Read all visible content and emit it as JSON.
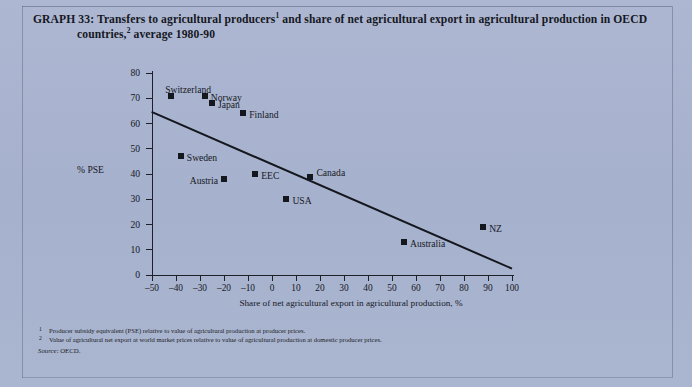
{
  "page": {
    "background_color": "#a9b4cf",
    "ink_color": "#16181f"
  },
  "title": {
    "line1_prefix": "GRAPH 33: Transfers to agricultural producers",
    "line1_sup": "1",
    "line1_rest": " and share of net agricultural export in agricultural production in OECD",
    "line2_prefix": "countries,",
    "line2_sup": "2",
    "line2_rest": " average 1980-90"
  },
  "notes": {
    "note1_marker": "1",
    "note1": "Producer subsidy equivalent (PSE) relative to value of agricultural production at producer prices.",
    "note2_marker": "2",
    "note2": "Value of agricultural net export at world market prices relative to value of agricultural production at domestic producer prices.",
    "source_label": "Source",
    "source_value": ": OECD."
  },
  "chart_data": {
    "type": "scatter",
    "xlabel": "Share of net agricultural export in agricultural production, %",
    "ylabel": "% PSE",
    "xlim": [
      -50,
      100
    ],
    "ylim": [
      0,
      80
    ],
    "xticks": [
      -50,
      -40,
      -30,
      -20,
      -10,
      0,
      10,
      20,
      30,
      40,
      50,
      60,
      70,
      80,
      90,
      100
    ],
    "xticklabels": [
      "–50",
      "–40",
      "–30",
      "–20",
      "–10",
      "0",
      "10",
      "20",
      "30",
      "40",
      "50",
      "60",
      "70",
      "80",
      "90",
      "100"
    ],
    "yticks": [
      0,
      10,
      20,
      30,
      40,
      50,
      60,
      70,
      80
    ],
    "yticklabels": [
      "0",
      "10",
      "20",
      "30",
      "40",
      "50",
      "60",
      "70",
      "80"
    ],
    "grid": false,
    "legend": "none",
    "marker_color": "#15171e",
    "points": [
      {
        "label": "Switzerland",
        "x": -42,
        "y": 71,
        "label_dx": -6,
        "label_dy": -12,
        "label_align": "left"
      },
      {
        "label": "Norway",
        "x": -28,
        "y": 71,
        "label_dx": 6,
        "label_dy": -4,
        "label_align": "left"
      },
      {
        "label": "Japan",
        "x": -25,
        "y": 68,
        "label_dx": 6,
        "label_dy": -4,
        "label_align": "left"
      },
      {
        "label": "Finland",
        "x": -12,
        "y": 64,
        "label_dx": 6,
        "label_dy": -4,
        "label_align": "left"
      },
      {
        "label": "Sweden",
        "x": -38,
        "y": 47,
        "label_dx": 6,
        "label_dy": -4,
        "label_align": "left"
      },
      {
        "label": "Austria",
        "x": -20,
        "y": 38,
        "label_dx": -6,
        "label_dy": -4,
        "label_align": "right"
      },
      {
        "label": "EEC",
        "x": -7,
        "y": 40,
        "label_dx": 6,
        "label_dy": -4,
        "label_align": "left"
      },
      {
        "label": "Canada",
        "x": 16,
        "y": 39,
        "label_dx": 6,
        "label_dy": -10,
        "label_align": "left"
      },
      {
        "label": "USA",
        "x": 6,
        "y": 30,
        "label_dx": 6,
        "label_dy": -4,
        "label_align": "left"
      },
      {
        "label": "Australia",
        "x": 55,
        "y": 13,
        "label_dx": 6,
        "label_dy": -4,
        "label_align": "left"
      },
      {
        "label": "NZ",
        "x": 88,
        "y": 19,
        "label_dx": 6,
        "label_dy": -4,
        "label_align": "left"
      }
    ],
    "trendline": {
      "type": "linear",
      "x_start": -50,
      "y_start": 65,
      "x_end": 100,
      "y_end": 3
    }
  }
}
